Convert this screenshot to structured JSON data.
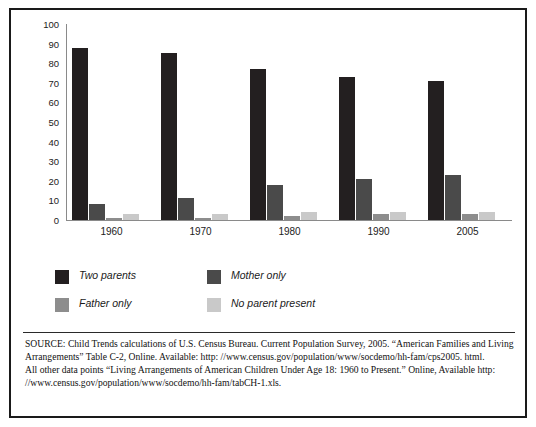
{
  "chart_data": {
    "type": "bar",
    "title": "",
    "xlabel": "",
    "ylabel": "",
    "ylim": [
      0,
      100
    ],
    "yticks": [
      100,
      90,
      80,
      70,
      60,
      50,
      40,
      30,
      20,
      10,
      0
    ],
    "grid": false,
    "legend_position": "below-plot",
    "categories": [
      "1960",
      "1970",
      "1980",
      "1990",
      "2005"
    ],
    "series": [
      {
        "name": "Two parents",
        "color": "#231f20",
        "values": [
          88,
          85,
          77,
          73,
          71
        ]
      },
      {
        "name": "Mother only",
        "color": "#4a4a4a",
        "values": [
          8,
          11,
          18,
          21,
          23
        ]
      },
      {
        "name": "Father only",
        "color": "#8d8d8d",
        "values": [
          1,
          1,
          2,
          3,
          3
        ]
      },
      {
        "name": "No parent present",
        "color": "#c9c9c9",
        "values": [
          3,
          3,
          4,
          4,
          4
        ]
      }
    ]
  },
  "legend": {
    "items": [
      {
        "label": "Two parents",
        "color": "#231f20"
      },
      {
        "label": "Mother only",
        "color": "#4a4a4a"
      },
      {
        "label": "Father only",
        "color": "#8d8d8d"
      },
      {
        "label": "No parent present",
        "color": "#c9c9c9"
      }
    ]
  },
  "footnote": {
    "line1": "SOURCE: Child Trends calculations of U.S. Census Bureau. Current Population Survey, 2005. “American Families and Living Arrangements” Table C-2, Online. Available: http: //www.census.gov/population/www/socdemo/hh-fam/cps2005. html.",
    "line2": "All other data points “Living Arrangements of American Children Under Age 18: 1960 to Present.” Online, Available http: //www.census.gov/population/www/socdemo/hh-fam/tabCH-1.xls."
  }
}
